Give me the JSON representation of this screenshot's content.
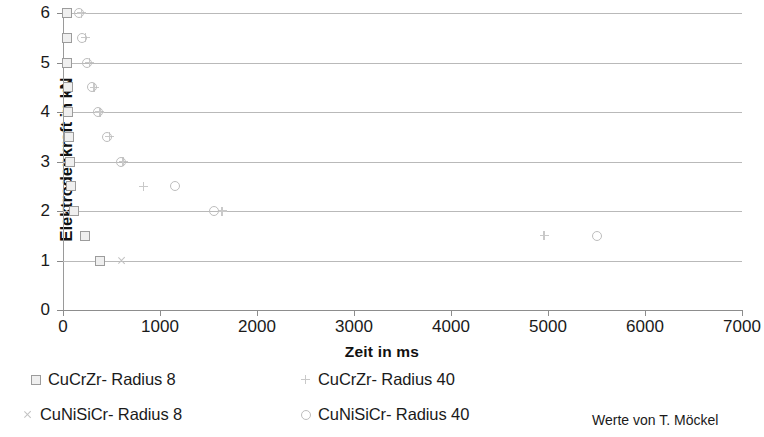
{
  "chart_data": {
    "type": "scatter",
    "title": "",
    "xlabel": "Zeit in ms",
    "ylabel": "Elektrodenkraft in kN",
    "xlim": [
      0,
      7000
    ],
    "ylim": [
      0,
      6
    ],
    "xticks": [
      0,
      1000,
      2000,
      3000,
      4000,
      5000,
      6000,
      7000
    ],
    "yticks": [
      0,
      1,
      2,
      3,
      4,
      5,
      6
    ],
    "grid": "horizontal",
    "legend_position": "bottom",
    "annotation": "Werte von T. Möckel",
    "series": [
      {
        "name": "CuCrZr- Radius 8",
        "marker": "square",
        "color": "#9c9c9c",
        "points": [
          [
            40,
            6.0
          ],
          [
            40,
            5.5
          ],
          [
            45,
            5.0
          ],
          [
            50,
            4.5
          ],
          [
            55,
            4.0
          ],
          [
            60,
            3.5
          ],
          [
            70,
            3.0
          ],
          [
            80,
            2.5
          ],
          [
            110,
            2.0
          ],
          [
            230,
            1.5
          ],
          [
            380,
            1.0
          ]
        ]
      },
      {
        "name": "CuCrZr- Radius 40",
        "marker": "plus",
        "color": "#c9c9c9",
        "points": [
          [
            190,
            6.0
          ],
          [
            230,
            5.5
          ],
          [
            275,
            5.0
          ],
          [
            320,
            4.5
          ],
          [
            380,
            4.0
          ],
          [
            480,
            3.5
          ],
          [
            620,
            3.0
          ],
          [
            830,
            2.5
          ],
          [
            1640,
            2.0
          ],
          [
            4960,
            1.5
          ]
        ]
      },
      {
        "name": "CuNiSiCr- Radius 8",
        "marker": "cross",
        "color": "#c2c2c2",
        "points": [
          [
            610,
            1.0
          ]
        ]
      },
      {
        "name": "CuNiSiCr- Radius 40",
        "marker": "circle",
        "color": "#bdbdbd",
        "points": [
          [
            165,
            6.0
          ],
          [
            200,
            5.5
          ],
          [
            250,
            5.0
          ],
          [
            295,
            4.5
          ],
          [
            360,
            4.0
          ],
          [
            450,
            3.5
          ],
          [
            595,
            3.0
          ],
          [
            1150,
            2.5
          ],
          [
            1560,
            2.0
          ],
          [
            5500,
            1.5
          ]
        ]
      }
    ]
  },
  "axes": {
    "ylabel": "Elektrodenkraft in kN",
    "xlabel": "Zeit in ms",
    "ytick_labels": [
      "6",
      "5",
      "4",
      "3",
      "2",
      "1",
      "0"
    ],
    "xtick_labels": [
      "0",
      "1000",
      "2000",
      "3000",
      "4000",
      "5000",
      "6000",
      "7000"
    ]
  },
  "legend": {
    "items": [
      {
        "label": "CuCrZr- Radius 8",
        "marker": "square"
      },
      {
        "label": "CuCrZr- Radius 40",
        "marker": "plus"
      },
      {
        "label": "CuNiSiCr- Radius 8",
        "marker": "cross"
      },
      {
        "label": "CuNiSiCr- Radius 40",
        "marker": "circle"
      }
    ],
    "credit": "Werte von T. Möckel"
  }
}
